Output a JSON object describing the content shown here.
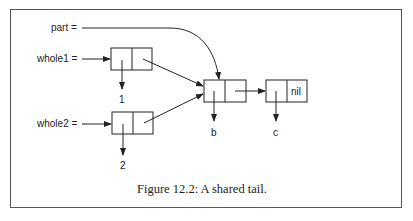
{
  "figure": {
    "caption": "Figure 12.2: A shared tail.",
    "variables": [
      {
        "name": "part",
        "label": "part ="
      },
      {
        "name": "whole1",
        "label": "whole1 ="
      },
      {
        "name": "whole2",
        "label": "whole2 ="
      }
    ],
    "cells": [
      {
        "id": "cell-whole1",
        "car": "1",
        "cdr": "→ cell-b"
      },
      {
        "id": "cell-whole2",
        "car": "2",
        "cdr": "→ cell-b"
      },
      {
        "id": "cell-b",
        "car": "b",
        "cdr": "→ cell-c"
      },
      {
        "id": "cell-c",
        "car": "c",
        "cdr": "nil"
      }
    ],
    "values": {
      "one": "1",
      "two": "2",
      "b": "b",
      "c": "c",
      "nil": "nil"
    }
  }
}
